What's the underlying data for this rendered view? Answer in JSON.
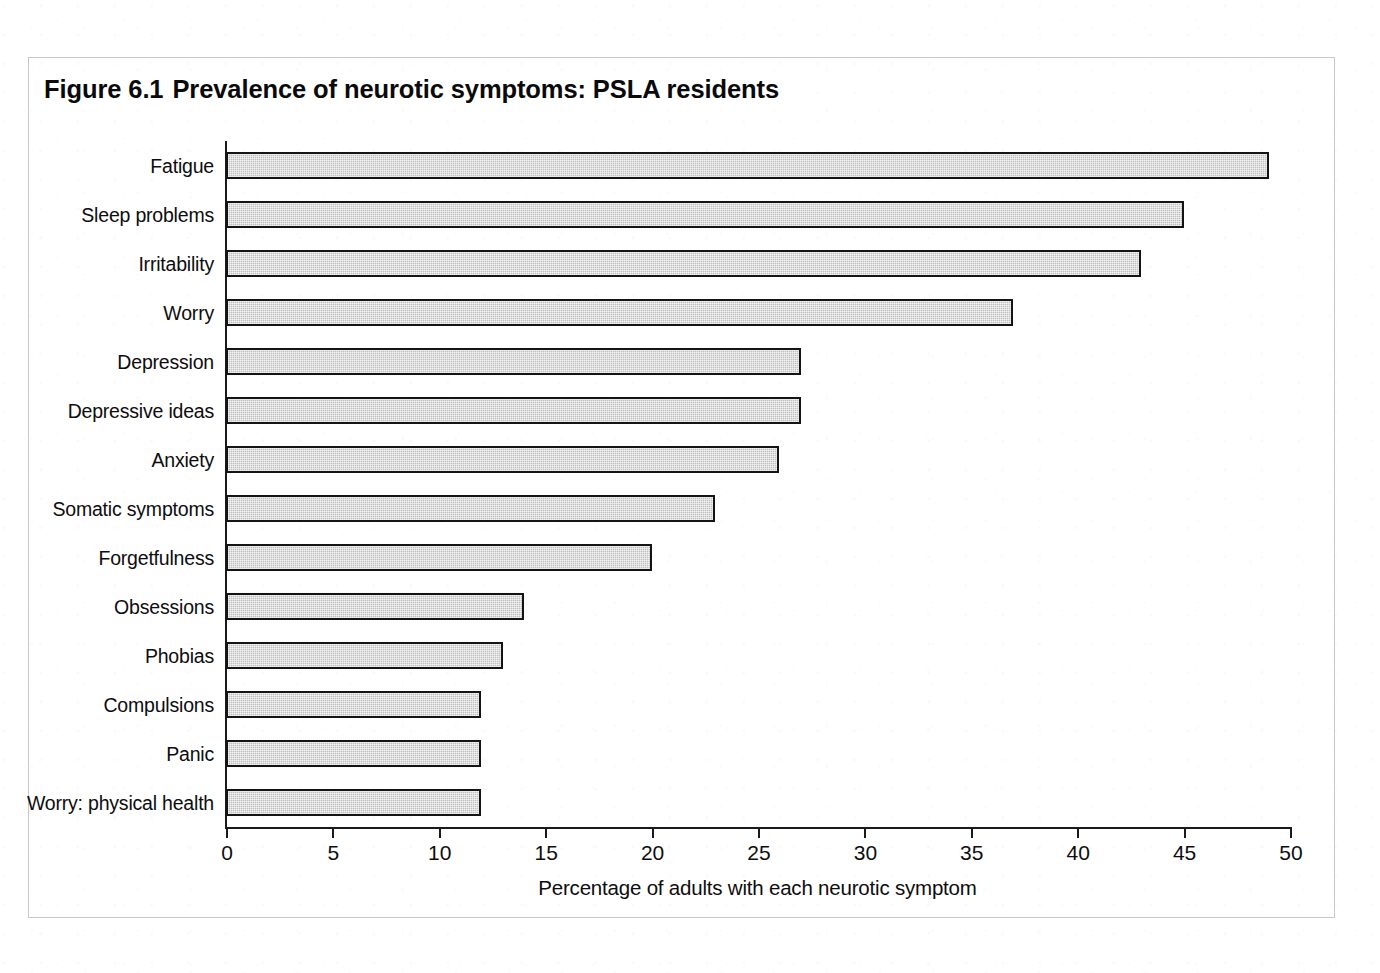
{
  "figure": {
    "number": "Figure 6.1",
    "title": "Prevalence of neurotic symptoms: PSLA residents"
  },
  "chart_data": {
    "type": "bar",
    "orientation": "horizontal",
    "xlabel": "Percentage of adults with each neurotic symptom",
    "ylabel": "",
    "xlim": [
      0,
      50
    ],
    "xticks": [
      0,
      5,
      10,
      15,
      20,
      25,
      30,
      35,
      40,
      45,
      50
    ],
    "xtick_labels": [
      "0",
      "5",
      "10",
      "15",
      "20",
      "25",
      "30",
      "35",
      "40",
      "45",
      "50"
    ],
    "grid": false,
    "legend": false,
    "bar_fill_color": "#bfbfbf",
    "bar_edge_color": "#141414",
    "categories": [
      "Fatigue",
      "Sleep problems",
      "Irritability",
      "Worry",
      "Depression",
      "Depressive ideas",
      "Anxiety",
      "Somatic symptoms",
      "Forgetfulness",
      "Obsessions",
      "Phobias",
      "Compulsions",
      "Panic",
      "Worry: physical health"
    ],
    "values": [
      49,
      45,
      43,
      37,
      27,
      27,
      26,
      23,
      20,
      14,
      13,
      12,
      12,
      12
    ]
  }
}
